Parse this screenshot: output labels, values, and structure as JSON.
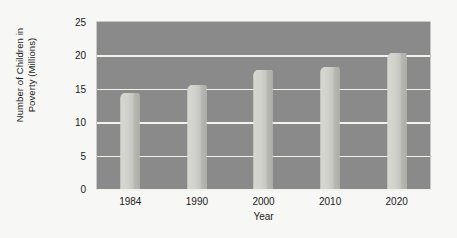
{
  "chart_data": {
    "type": "bar",
    "title": "",
    "categories": [
      "1984",
      "1990",
      "2000",
      "2010",
      "2020"
    ],
    "values": [
      14.3,
      15.5,
      17.8,
      18.2,
      20.3
    ],
    "xlabel": "Year",
    "ylabel": "Number of Children in Poverty (Millions)",
    "ylabel_line1": "Number of Children in",
    "ylabel_line2": "Poverty (Millions)",
    "ylim": [
      0,
      25
    ],
    "yticks": [
      "0",
      "5",
      "10",
      "15",
      "20",
      "25"
    ],
    "ytick_values": [
      0,
      5,
      10,
      15,
      20,
      25
    ],
    "grid": true,
    "legend": "none",
    "series": [
      {
        "name": "Number of Children in Poverty (Millions)",
        "values": [
          14.3,
          15.5,
          17.8,
          18.2,
          20.3
        ]
      }
    ]
  },
  "colors": {
    "canvas": "#f7f7f5",
    "plot_background": "#8a8a8a",
    "gridline": "#f2f2ee",
    "bar_face": "#d4d4cf",
    "bar_side": "#b3b3ae",
    "text": "#1a1a1a"
  }
}
